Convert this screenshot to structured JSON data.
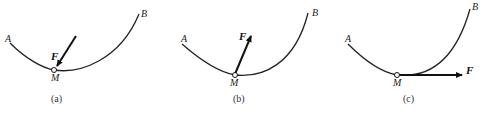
{
  "panels": [
    {
      "caption": "(a)",
      "start_label": "A",
      "end_label": "B",
      "point_label": "M",
      "force_label": "F",
      "force_direction": "pointing down-left into M (inward, toward concave side)"
    },
    {
      "caption": "(b)",
      "start_label": "A",
      "end_label": "B",
      "point_label": "M",
      "force_label": "F",
      "force_direction": "pointing up-right away from M (toward concave side)"
    },
    {
      "caption": "(c)",
      "start_label": "A",
      "end_label": "B",
      "point_label": "M",
      "force_label": "F",
      "force_direction": "horizontal to the right, tangent at M"
    }
  ],
  "colors": {
    "line": "#222222",
    "background": "#ffffff"
  }
}
